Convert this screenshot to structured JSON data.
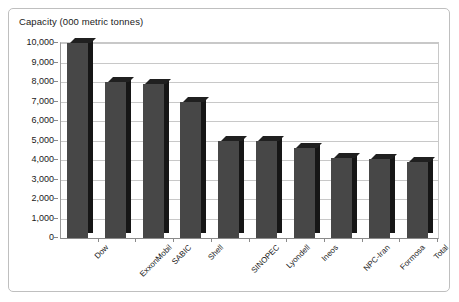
{
  "chart_data": {
    "type": "bar",
    "title": "Capacity (000 metric tonnes)",
    "xlabel": "",
    "ylabel": "",
    "ylim": [
      0,
      10000
    ],
    "grid": true,
    "legend": "none",
    "categories": [
      "Dow",
      "ExxonMobil",
      "SABIC",
      "Shell",
      "SINOPEC",
      "Lyondell",
      "Ineos",
      "NPC-Iran",
      "Formosa",
      "Total"
    ],
    "values": [
      10000,
      8000,
      7900,
      7000,
      5000,
      4950,
      4600,
      4100,
      4050,
      3900
    ],
    "y_ticks": [
      {
        "value": 10000,
        "label": "10,000"
      },
      {
        "value": 9000,
        "label": "9,000"
      },
      {
        "value": 8000,
        "label": "8,000"
      },
      {
        "value": 7000,
        "label": "7,000"
      },
      {
        "value": 6000,
        "label": "6,000"
      },
      {
        "value": 5000,
        "label": "5,000"
      },
      {
        "value": 4000,
        "label": "4,000"
      },
      {
        "value": 3000,
        "label": "3,000"
      },
      {
        "value": 2000,
        "label": "2,000"
      },
      {
        "value": 1000,
        "label": "1,000"
      },
      {
        "value": 0,
        "label": "0"
      }
    ],
    "colors": {
      "bar_front": "#474747",
      "bar_side": "#161616",
      "bar_top": "#202020",
      "gridline": "#c8c8c8",
      "axis": "#8a8a8a",
      "frame": "#bfbfbf",
      "background": "#ffffff",
      "text": "#1a1a1a"
    }
  }
}
